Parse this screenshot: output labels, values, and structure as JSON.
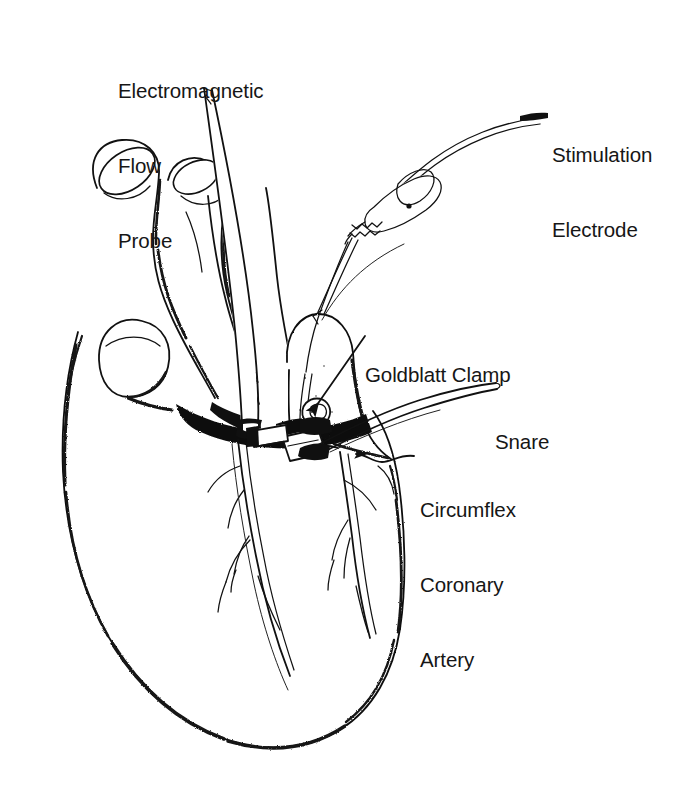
{
  "figure": {
    "background_color": "#ffffff",
    "ink_color": "#111111",
    "style": "black-and-white stippled pen-and-ink anatomical line drawing",
    "view": "anterior view of the heart with surgical instrumentation"
  },
  "labels": {
    "electromagnetic_flow_probe": {
      "lines": [
        "Electromagnetic",
        "Flow",
        "Probe"
      ],
      "line1": "Electromagnetic",
      "line2": "Flow",
      "line3": "Probe",
      "position": "top-left",
      "leader": "none-adjacent-to-probe-cable"
    },
    "stimulation_electrode": {
      "lines": [
        "Stimulation",
        "Electrode"
      ],
      "line1": "Stimulation",
      "line2": "Electrode",
      "position": "top-right",
      "leader": "short-horizontal-tick-to-electrode-cable"
    },
    "goldblatt_clamp": {
      "lines": [
        "Goldblatt Clamp"
      ],
      "line1": "Goldblatt Clamp",
      "position": "middle-right",
      "leader": "diagonal-arrow-pointing-down-left"
    },
    "snare": {
      "lines": [
        "Snare"
      ],
      "line1": "Snare",
      "position": "middle-right",
      "leader": "long-curved-tapering-tube"
    },
    "circumflex_coronary_artery": {
      "lines": [
        "Circumflex",
        "Coronary",
        "Artery"
      ],
      "line1": "Circumflex",
      "line2": "Coronary",
      "line3": "Artery",
      "position": "right",
      "leader": "wavy-line-with-small-left-arrowhead"
    }
  },
  "anatomy": {
    "parts": [
      "aorta",
      "pulmonary artery",
      "superior vena cava",
      "right atrial appendage",
      "left atrial appendage",
      "right ventricle",
      "left ventricle",
      "anterior interventricular groove",
      "left anterior descending coronary artery",
      "circumflex coronary artery",
      "diagonal coronary branches"
    ]
  },
  "instruments": {
    "items": [
      {
        "name": "electromagnetic flow probe",
        "description": "tapered cable entering from top, passing behind the great vessels to the coronary artery"
      },
      {
        "name": "stimulation electrode",
        "description": "alligator-clip electrode on a cable entering from upper right, attached to the atrium"
      },
      {
        "name": "goldblatt clamp",
        "description": "small adjustable screw clamp on the circumflex coronary artery"
      },
      {
        "name": "snare",
        "description": "curved tube occluder looped around the coronary artery, exiting to the right"
      }
    ]
  }
}
